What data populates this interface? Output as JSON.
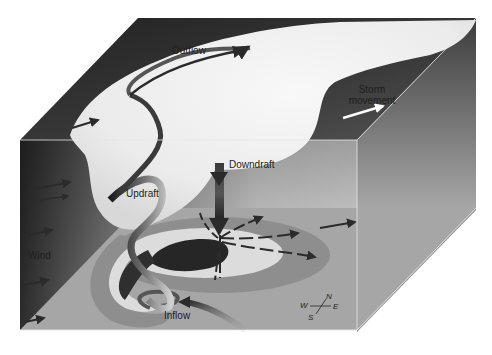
{
  "diagram": {
    "labels": {
      "outflow": "Outflow",
      "storm_movement_line1": "Storm",
      "storm_movement_line2": "movement",
      "downdraft": "Downdraft",
      "updraft": "Updraft",
      "wind": "Wind",
      "inflow": "Inflow"
    },
    "compass": {
      "north": "N",
      "south": "S",
      "east": "E",
      "west": "W"
    },
    "colors": {
      "sky_dark": "#3a3a3a",
      "sky_mid": "#8a8a8a",
      "cloud": "#efefef",
      "ground": "#a6a6a6",
      "ground_side": "#9a9a9a",
      "outer_ring": "#8c8c8c",
      "light_ring": "#d9d9d9",
      "dark_core": "#2a2a2a",
      "arrow": "#2b2b2b",
      "storm_arrow": "#ffffff",
      "edge_line": "#e6e6e6"
    }
  }
}
